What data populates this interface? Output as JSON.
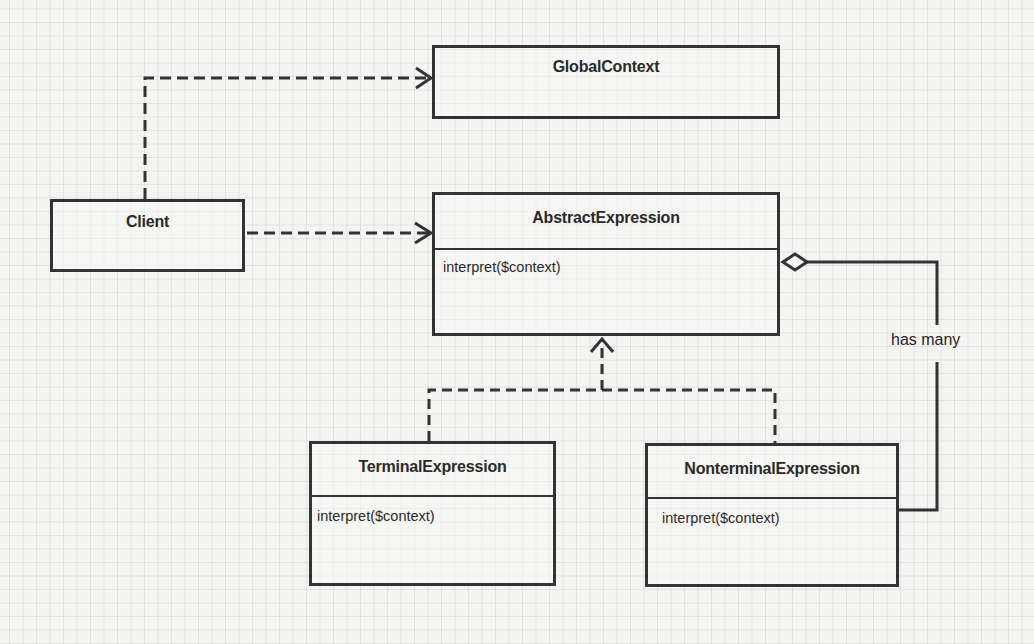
{
  "diagram": {
    "type": "uml-class-diagram",
    "classes": [
      {
        "id": "global_context",
        "name": "GlobalContext",
        "methods": []
      },
      {
        "id": "client",
        "name": "Client",
        "methods": []
      },
      {
        "id": "abstract_expression",
        "name": "AbstractExpression",
        "methods": [
          "interpret($context)"
        ]
      },
      {
        "id": "terminal_expression",
        "name": "TerminalExpression",
        "methods": [
          "interpret($context)"
        ]
      },
      {
        "id": "nonterminal_expression",
        "name": "NonterminalExpression",
        "methods": [
          "interpret($context)"
        ]
      }
    ],
    "relations": [
      {
        "from": "Client",
        "to": "GlobalContext",
        "kind": "dependency",
        "style": "dashed-open-arrow"
      },
      {
        "from": "Client",
        "to": "AbstractExpression",
        "kind": "dependency",
        "style": "dashed-open-arrow"
      },
      {
        "from": "TerminalExpression",
        "to": "AbstractExpression",
        "kind": "realization",
        "style": "dashed-open-arrow"
      },
      {
        "from": "NonterminalExpression",
        "to": "AbstractExpression",
        "kind": "realization",
        "style": "dashed-open-arrow"
      },
      {
        "from": "AbstractExpression",
        "to": "NonterminalExpression",
        "kind": "aggregation",
        "style": "solid-open-diamond",
        "label": "has many"
      }
    ],
    "labels": {
      "aggregation": "has many"
    },
    "colors": {
      "stroke": "#333333",
      "text": "#2a2a2a",
      "background": "#f4f4f2",
      "grid": "#c8c8c8"
    }
  }
}
